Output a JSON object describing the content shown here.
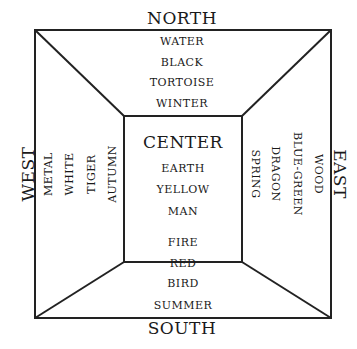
{
  "diagram": {
    "directions": {
      "north": "NORTH",
      "south": "SOUTH",
      "west": "WEST",
      "east": "EAST"
    },
    "north": [
      "WATER",
      "BLACK",
      "TORTOISE",
      "WINTER"
    ],
    "center": {
      "title": "CENTER",
      "items": [
        "EARTH",
        "YELLOW",
        "MAN"
      ]
    },
    "south": [
      "FIRE",
      "RED",
      "BIRD",
      "SUMMER"
    ],
    "west": [
      "METAL",
      "WHITE",
      "TIGER",
      "AUTUMN"
    ],
    "east": [
      "SPRING",
      "DRAGON",
      "BLUE-GREEN",
      "WOOD"
    ],
    "line_color": "#222222"
  }
}
